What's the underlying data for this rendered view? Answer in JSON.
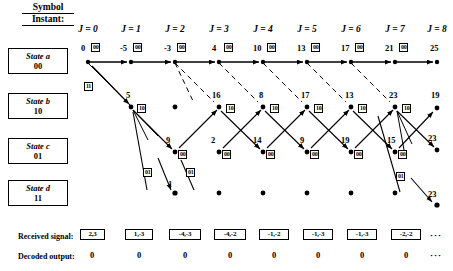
{
  "header": {
    "symbol_word": "Symbol",
    "instant_word": "Instant:",
    "columns": [
      {
        "label": "J = 0",
        "x": 88
      },
      {
        "label": "J = 1",
        "x": 130
      },
      {
        "label": "J = 2",
        "x": 175
      },
      {
        "label": "J = 3",
        "x": 221
      },
      {
        "label": "J = 4",
        "x": 266
      },
      {
        "label": "J = 5",
        "x": 311
      },
      {
        "label": "J = 6",
        "x": 356
      },
      {
        "label": "J = 7",
        "x": 398
      },
      {
        "label": "J = 8",
        "x": 436
      }
    ]
  },
  "states": [
    {
      "name": "State a",
      "bits": "00",
      "top": 48
    },
    {
      "name": "State b",
      "bits": "10",
      "top": 93
    },
    {
      "name": "State c",
      "bits": "01",
      "top": 138
    },
    {
      "name": "State d",
      "bits": "11",
      "top": 180
    }
  ],
  "trellis": {
    "row_y": {
      "a": 62,
      "b": 107,
      "c": 152,
      "d": 194
    },
    "stage_x": [
      88,
      131,
      175,
      219,
      263,
      307,
      351,
      395,
      437
    ],
    "path_metrics": {
      "a": [
        "0",
        "-5",
        "-3",
        "4",
        "10",
        "13",
        "17",
        "21",
        "25"
      ],
      "b": [
        "",
        "5",
        "",
        "16",
        "8",
        "17",
        "13",
        "23",
        "19"
      ],
      "c": [
        "",
        "",
        "9",
        "2",
        "14",
        "9",
        "19",
        "15",
        "23"
      ],
      "d": [
        "",
        "",
        "",
        "1",
        "",
        "",
        "",
        "",
        "23"
      ]
    },
    "branch_labels": {
      "a": [
        "00",
        "00",
        "00",
        "00",
        "00",
        "00",
        "00",
        "00"
      ],
      "b": [
        "10",
        "10",
        "10",
        "10",
        "10",
        "10",
        "10"
      ],
      "c": [
        "00",
        "00",
        "00",
        "00",
        "00",
        "00",
        "00"
      ],
      "d": [
        "01",
        "01",
        "01"
      ],
      "start_11": "11"
    }
  },
  "bottom": {
    "received_label": "Received signal:",
    "received_values": [
      "2,3",
      "1,-3",
      "-4,-3",
      "-4,-2",
      "-1,-2",
      "-1,-3",
      "-1,-3",
      "-2,-2"
    ],
    "received_ellipsis": "···",
    "decoded_label": "Decoded output:",
    "decoded_values": [
      "0",
      "0",
      "0",
      "0",
      "0",
      "0",
      "0",
      "0"
    ],
    "decoded_ellipsis": "···"
  },
  "colors": {
    "ink": "#000000",
    "paper": "#ffffff"
  }
}
